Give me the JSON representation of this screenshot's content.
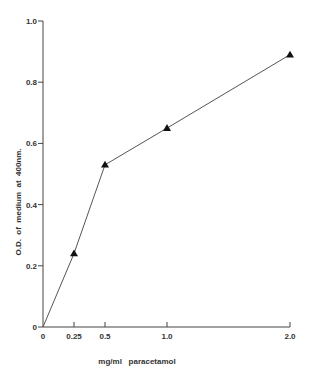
{
  "chart_data": {
    "type": "line",
    "title": "",
    "xlabel": "mg/ml   paracetamol",
    "ylabel": "O.D.  of  medium  at  400nm.",
    "x_tick_labels": [
      "0",
      "0.25",
      "0.5",
      "1.0",
      "2.0"
    ],
    "x_ticks": [
      0,
      0.25,
      0.5,
      1.0,
      2.0
    ],
    "x_scale_note": "non-uniform spacing: 0-0.5 segment drawn at double scale relative to 1.0-2.0",
    "y_tick_labels": [
      "0",
      "0.2",
      "0.4",
      "0.6",
      "0.8",
      "1.0"
    ],
    "y_ticks": [
      0,
      0.2,
      0.4,
      0.6,
      0.8,
      1.0
    ],
    "ylim": [
      0,
      1.0
    ],
    "grid": false,
    "legend": null,
    "series": [
      {
        "name": "O.D. at 400nm",
        "marker": "triangle",
        "x": [
          0,
          0.25,
          0.5,
          1.0,
          2.0
        ],
        "values": [
          0,
          0.24,
          0.53,
          0.65,
          0.89
        ]
      }
    ]
  },
  "colors": {
    "line": "#555555",
    "marker": "#111111",
    "axis": "#444444"
  }
}
